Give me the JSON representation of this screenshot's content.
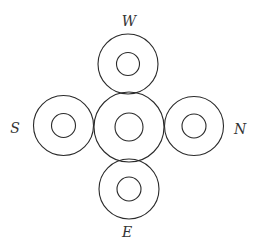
{
  "diagram": {
    "width": 255,
    "height": 247,
    "stroke_color": "#2a2a2a",
    "label_color": "#333333",
    "center": {
      "name": "center-ring",
      "cx": 129,
      "cy": 127,
      "outer_r": 35,
      "inner_r": 14
    },
    "rings": [
      {
        "name": "w-ring",
        "label": "W",
        "cx": 128,
        "cy": 64,
        "outer_r": 30,
        "inner_r": 11.5,
        "label_x": 129,
        "label_y": 21
      },
      {
        "name": "s-ring",
        "label": "S",
        "cx": 63.5,
        "cy": 125.5,
        "outer_r": 30,
        "inner_r": 12,
        "label_x": 15,
        "label_y": 128
      },
      {
        "name": "n-ring",
        "label": "N",
        "cx": 194,
        "cy": 126,
        "outer_r": 29.5,
        "inner_r": 12,
        "label_x": 240,
        "label_y": 129
      },
      {
        "name": "e-ring",
        "label": "E",
        "cx": 129,
        "cy": 189,
        "outer_r": 30,
        "inner_r": 12,
        "label_x": 127,
        "label_y": 232
      }
    ]
  },
  "labels": {
    "w": "W",
    "s": "S",
    "n": "N",
    "e": "E"
  }
}
